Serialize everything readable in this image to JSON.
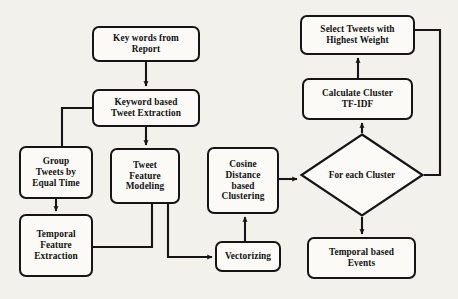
{
  "diagram": {
    "background_color": "#f3f1ec",
    "stroke_color": "#151515",
    "node_fill": "#fbfaf7",
    "nodes": [
      {
        "id": "key_words",
        "shape": "rounded-rect",
        "label": "Key words from Report",
        "line1": "Key words from",
        "line2": "Report",
        "line3": "",
        "line4": "",
        "x": 92,
        "y": 26,
        "w": 108,
        "h": 36
      },
      {
        "id": "keyword_based",
        "shape": "rounded-rect",
        "label": "Keyword based Tweet Extraction",
        "line1": "Keyword based",
        "line2": "Tweet Extraction",
        "line3": "",
        "line4": "",
        "x": 92,
        "y": 89,
        "w": 108,
        "h": 38
      },
      {
        "id": "group_tweets",
        "shape": "rounded-rect",
        "label": "Group Tweets by Equal Time",
        "line1": "Group",
        "line2": "Tweets by",
        "line3": "Equal Time",
        "line4": "",
        "x": 19,
        "y": 146,
        "w": 74,
        "h": 53
      },
      {
        "id": "temporal_feature",
        "shape": "rounded-rect",
        "label": "Temporal Feature Extraction",
        "line1": "Temporal",
        "line2": "Feature",
        "line3": "Extraction",
        "line4": "",
        "x": 19,
        "y": 214,
        "w": 74,
        "h": 63
      },
      {
        "id": "tweet_feature",
        "shape": "rounded-rect",
        "label": "Tweet Feature Modeling",
        "line1": "Tweet",
        "line2": "Feature",
        "line3": "Modeling",
        "line4": "",
        "x": 110,
        "y": 148,
        "w": 70,
        "h": 56
      },
      {
        "id": "cosine_distance",
        "shape": "rounded-rect",
        "label": "Cosine Distance based Clustering",
        "line1": "Cosine",
        "line2": "Distance",
        "line3": "based",
        "line4": "Clustering",
        "x": 207,
        "y": 147,
        "w": 72,
        "h": 67
      },
      {
        "id": "vectorizing",
        "shape": "rounded-rect",
        "label": "Vectorizing",
        "line1": "Vectorizing",
        "line2": "",
        "line3": "",
        "line4": "",
        "x": 215,
        "y": 241,
        "w": 66,
        "h": 31
      },
      {
        "id": "temporal_events",
        "shape": "rounded-rect",
        "label": "Temporal based Events",
        "line1": "Temporal based",
        "line2": "Events",
        "line3": "",
        "line4": "",
        "x": 307,
        "y": 237,
        "w": 109,
        "h": 42
      },
      {
        "id": "calculate_tfidf",
        "shape": "rounded-rect",
        "label": "Calculate Cluster TF-IDF",
        "line1": "Calculate Cluster",
        "line2": "TF-IDF",
        "line3": "",
        "line4": "",
        "x": 302,
        "y": 78,
        "w": 111,
        "h": 42
      },
      {
        "id": "select_tweets",
        "shape": "rounded-rect",
        "label": "Select Tweets with Highest Weight",
        "line1": "Select Tweets with",
        "line2": "Highest Weight",
        "line3": "",
        "line4": "",
        "x": 300,
        "y": 15,
        "w": 115,
        "h": 40
      },
      {
        "id": "for_each_cluster",
        "shape": "diamond",
        "label": "For each Cluster",
        "line1": "For each",
        "line2": "Cluster",
        "line3": "",
        "line4": "",
        "x": 300,
        "y": 133,
        "w": 124,
        "h": 84
      }
    ],
    "edges": [
      {
        "from": "key_words",
        "to": "keyword_based",
        "type": "arrow",
        "description": "Key words from Report down to Keyword based Tweet Extraction"
      },
      {
        "from": "keyword_based",
        "to": "group_tweets",
        "type": "line",
        "description": "Keyword based Tweet Extraction left then down to Group Tweets by Equal Time"
      },
      {
        "from": "keyword_based",
        "to": "tweet_feature",
        "type": "arrow",
        "description": "Keyword based Tweet Extraction down to Tweet Feature Modeling"
      },
      {
        "from": "group_tweets",
        "to": "temporal_feature",
        "type": "arrow",
        "description": "Group Tweets by Equal Time down to Temporal Feature Extraction"
      },
      {
        "from": "tweet_feature",
        "to": "temporal_feature",
        "type": "line",
        "description": "Tweet Feature Modeling down then left to Temporal Feature Extraction"
      },
      {
        "from": "tweet_feature",
        "to": "vectorizing",
        "type": "arrow",
        "description": "Tweet Feature Modeling down then right to Vectorizing"
      },
      {
        "from": "vectorizing",
        "to": "cosine_distance",
        "type": "arrow",
        "description": "Vectorizing up to Cosine Distance based Clustering"
      },
      {
        "from": "cosine_distance",
        "to": "for_each_cluster",
        "type": "arrow",
        "description": "Cosine Distance based Clustering right to For each Cluster"
      },
      {
        "from": "for_each_cluster",
        "to": "calculate_tfidf",
        "type": "arrow",
        "description": "For each Cluster up to Calculate Cluster TF-IDF"
      },
      {
        "from": "for_each_cluster",
        "to": "temporal_events",
        "type": "arrow",
        "description": "For each Cluster down to Temporal based Events"
      },
      {
        "from": "calculate_tfidf",
        "to": "select_tweets",
        "type": "arrow",
        "description": "Calculate Cluster TF-IDF up to Select Tweets with Highest Weight"
      },
      {
        "from": "for_each_cluster",
        "to": "select_tweets",
        "type": "line",
        "description": "For each Cluster right then up to Select Tweets with Highest Weight"
      }
    ]
  }
}
